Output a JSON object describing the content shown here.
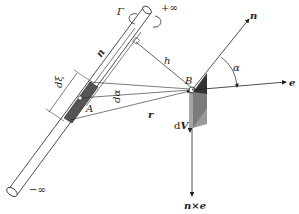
{
  "diagram": {
    "type": "vortex-filament-biot-savart",
    "labels": {
      "gamma": "Γ",
      "plus_inf": "+∞",
      "minus_inf": "−∞",
      "n_tube": "n",
      "h": "h",
      "B": "B",
      "n_vec": "n",
      "alpha": "α",
      "e": "e",
      "dxi": "dξ",
      "dalpha": "dα",
      "A": "A",
      "r": "r",
      "dV_d": "d",
      "dV_V": "V",
      "nxe": "n×e"
    },
    "colors": {
      "stroke": "#222222",
      "shade_dark": "#333333",
      "shade_mid": "#777777",
      "background": "#ffffff"
    }
  }
}
